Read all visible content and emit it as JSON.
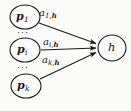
{
  "figure": {
    "type": "directed-graph",
    "width": 131,
    "height": 111,
    "background_color": "#fbfbfa",
    "stroke_color": "#1a1a1a",
    "text_color": "#1a1a1a"
  },
  "nodes": {
    "sources": [
      {
        "id": "p1",
        "base": "p",
        "subscript": "1",
        "cx": 25,
        "cy": 17,
        "rx": 15,
        "ry": 12
      },
      {
        "id": "pi",
        "base": "p",
        "subscript": "i",
        "cx": 25,
        "cy": 50,
        "rx": 15,
        "ry": 12
      },
      {
        "id": "pk",
        "base": "p",
        "subscript": "k",
        "cx": 26,
        "cy": 86,
        "rx": 15,
        "ry": 12
      }
    ],
    "target": {
      "id": "h",
      "base": "h",
      "subscript": "",
      "cx": 112,
      "cy": 48,
      "rx": 14,
      "ry": 13
    }
  },
  "ellipsis": [
    {
      "id": "ellipsis-upper",
      "glyph": "···",
      "x": 17,
      "y": 31
    },
    {
      "id": "ellipsis-lower",
      "glyph": "···",
      "x": 17,
      "y": 66
    }
  ],
  "edges": [
    {
      "id": "edge-p1-h",
      "from": "p1",
      "to": "h",
      "label_base": "a",
      "label_sub_index": "1,",
      "label_sub_target": "h",
      "label_x": 39,
      "label_y": 9,
      "x1": 39,
      "y1": 23,
      "x2": 97,
      "y2": 44
    },
    {
      "id": "edge-pi-h",
      "from": "pi",
      "to": "h",
      "label_base": "a",
      "label_sub_index": "i,",
      "label_sub_target": "h",
      "label_x": 43,
      "label_y": 38,
      "x1": 41,
      "y1": 50,
      "x2": 97,
      "y2": 48
    },
    {
      "id": "edge-pk-h",
      "from": "pk",
      "to": "h",
      "label_base": "a",
      "label_sub_index": "k,",
      "label_sub_target": "h",
      "label_x": 42,
      "label_y": 55,
      "x1": 40,
      "y1": 79,
      "x2": 97,
      "y2": 53
    }
  ]
}
